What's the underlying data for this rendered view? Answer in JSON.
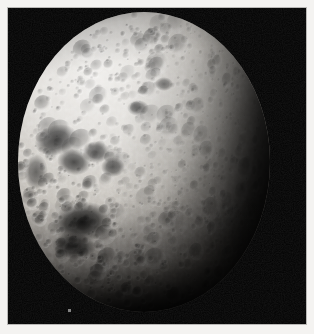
{
  "image": {
    "kind": "photograph",
    "subject": "heavily cratered moon",
    "caption": "",
    "alt_text": "Black-and-white photograph of a heavily cratered icy moon, lit from the upper left, with the right side fading into shadow along the terminator; a single faint star appears at right.",
    "width_px": 314,
    "height_px": 334
  },
  "frame": {
    "border_color": "#f4f3f1",
    "rule_color": "#b9b8b6",
    "border_width_px": 8
  },
  "sky": {
    "background_color": "#000000",
    "label": "space background"
  },
  "star": {
    "label": "background star",
    "color": "#efefef",
    "position_px": {
      "x": 251,
      "y": 113
    },
    "size_px": 4
  },
  "speck": {
    "label": "film speck",
    "color": "#a9a9a9"
  },
  "moon": {
    "label": "cratered moon disc",
    "highlight_color": "#e8e6e2",
    "midtone_color": "#a9a49d",
    "shadow_color": "#141312",
    "terminator_side": "right",
    "illumination_direction": "upper-left",
    "disc_px": {
      "left": 10,
      "top": 4,
      "width": 252,
      "height": 300
    }
  },
  "mare_regions": [
    {
      "name": "dark-basin-upper-left",
      "cx": 38,
      "cy": 128,
      "rx": 22,
      "ry": 15,
      "rot": -18,
      "opacity": 0.8
    },
    {
      "name": "dark-basin-mid-left",
      "cx": 56,
      "cy": 150,
      "rx": 17,
      "ry": 13,
      "rot": 12,
      "opacity": 0.74
    },
    {
      "name": "dark-crater-cluster-a",
      "cx": 78,
      "cy": 140,
      "rx": 14,
      "ry": 11,
      "rot": 0,
      "opacity": 0.7
    },
    {
      "name": "dark-crater-cluster-b",
      "cx": 95,
      "cy": 155,
      "rx": 12,
      "ry": 10,
      "rot": 0,
      "opacity": 0.66
    },
    {
      "name": "dark-floor-large",
      "cx": 64,
      "cy": 210,
      "rx": 30,
      "ry": 20,
      "rot": -8,
      "opacity": 0.86
    },
    {
      "name": "dark-floor-lower",
      "cx": 56,
      "cy": 234,
      "rx": 22,
      "ry": 13,
      "rot": 6,
      "opacity": 0.78
    },
    {
      "name": "dark-patch-left-edge",
      "cx": 18,
      "cy": 160,
      "rx": 12,
      "ry": 18,
      "rot": 0,
      "opacity": 0.55
    },
    {
      "name": "dark-crater-mid",
      "cx": 120,
      "cy": 96,
      "rx": 11,
      "ry": 8,
      "rot": 0,
      "opacity": 0.62
    },
    {
      "name": "dark-crater-upper-mid",
      "cx": 146,
      "cy": 72,
      "rx": 9,
      "ry": 7,
      "rot": 0,
      "opacity": 0.58
    }
  ]
}
